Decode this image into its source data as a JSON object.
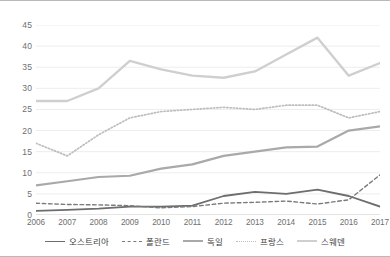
{
  "chart_data": {
    "type": "line",
    "title": "",
    "xlabel": "",
    "ylabel": "",
    "categories": [
      "2006",
      "2007",
      "2008",
      "2009",
      "2010",
      "2011",
      "2012",
      "2013",
      "2014",
      "2015",
      "2016",
      "2017"
    ],
    "ylim": [
      0,
      45
    ],
    "ytick_values": [
      0,
      5,
      10,
      15,
      20,
      25,
      30,
      35,
      40,
      45
    ],
    "ytick_labels": [
      "0",
      "5",
      "10",
      "15",
      "20",
      "25",
      "30",
      "35",
      "40",
      "45"
    ],
    "grid": true,
    "legend_position": "bottom",
    "series": [
      {
        "name": "오스트리아",
        "color": "#6d6d6d",
        "style": "solid",
        "width": 1.8,
        "values": [
          1.0,
          1.2,
          1.5,
          2.0,
          2.0,
          2.2,
          4.5,
          5.5,
          5.0,
          6.0,
          4.5,
          2.0
        ]
      },
      {
        "name": "폴란드",
        "color": "#7a7a7a",
        "style": "dashed",
        "width": 1.4,
        "values": [
          2.8,
          2.5,
          2.4,
          2.2,
          1.7,
          2.0,
          2.8,
          3.0,
          3.3,
          2.6,
          3.6,
          9.5
        ]
      },
      {
        "name": "독일",
        "color": "#a9a9a9",
        "style": "solid",
        "width": 2.2,
        "values": [
          7.0,
          8.0,
          9.0,
          9.3,
          11.0,
          12.0,
          14.0,
          15.0,
          16.0,
          16.2,
          20.0,
          21.0
        ]
      },
      {
        "name": "프랑스",
        "color": "#bdbdbd",
        "style": "dotted",
        "width": 1.7,
        "values": [
          17.0,
          14.0,
          19.0,
          23.0,
          24.5,
          25.0,
          25.5,
          25.0,
          26.0,
          26.0,
          23.0,
          24.5
        ]
      },
      {
        "name": "스웨덴",
        "color": "#cfcfcf",
        "style": "solid",
        "width": 2.4,
        "values": [
          27.0,
          27.0,
          30.0,
          36.5,
          34.5,
          33.0,
          32.5,
          34.0,
          38.0,
          42.0,
          33.0,
          36.0
        ]
      }
    ]
  }
}
